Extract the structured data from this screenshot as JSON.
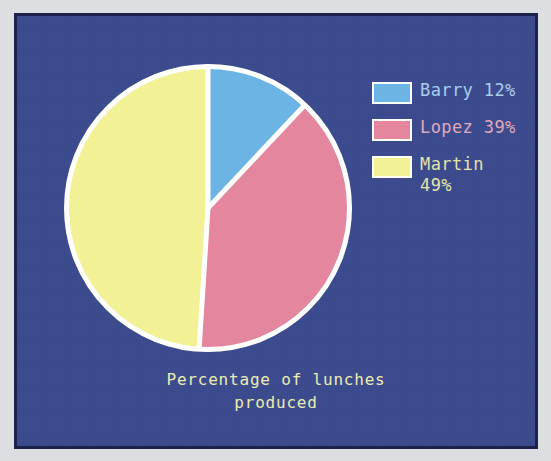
{
  "figure": {
    "background_color": "#3b4a8d",
    "frame_border_color": "#1b2148",
    "page_color": "#dcdee2",
    "separator_color": "#ffffff"
  },
  "caption": {
    "line1": "Percentage of lunches",
    "line2": "produced",
    "color": "#ecedb0"
  },
  "legend": {
    "items": [
      {
        "label": "Barry 12%",
        "swatch_color": "#6cb4e4",
        "text_color": "#a9cdee"
      },
      {
        "label": "Lopez 39%",
        "swatch_color": "#e4869e",
        "text_color": "#e0a8bb"
      },
      {
        "label": "Martin\n49%",
        "swatch_color": "#f2f195",
        "text_color": "#e4e4a8"
      }
    ]
  },
  "chart_data": {
    "type": "pie",
    "title": "Percentage of lunches produced",
    "subtitle": "",
    "xlabel": "",
    "ylabel": "",
    "legend_position": "right",
    "grid": false,
    "start_angle_deg": 90,
    "direction": "clockwise",
    "value_unit": "%",
    "total": 100,
    "categories": [
      "Barry",
      "Lopez",
      "Martin"
    ],
    "values": [
      12,
      39,
      49
    ],
    "labels": [
      "Barry 12%",
      "Lopez 39%",
      "Martin 49%"
    ],
    "colors": [
      "#6cb4e4",
      "#e4869e",
      "#f2f195"
    ],
    "slices": [
      {
        "name": "Barry",
        "value": 12,
        "color": "#6cb4e4",
        "start_deg": 0,
        "end_deg": 43.2
      },
      {
        "name": "Lopez",
        "value": 39,
        "color": "#e4869e",
        "start_deg": 43.2,
        "end_deg": 183.6
      },
      {
        "name": "Martin",
        "value": 49,
        "color": "#f2f195",
        "start_deg": 183.6,
        "end_deg": 360
      }
    ]
  }
}
